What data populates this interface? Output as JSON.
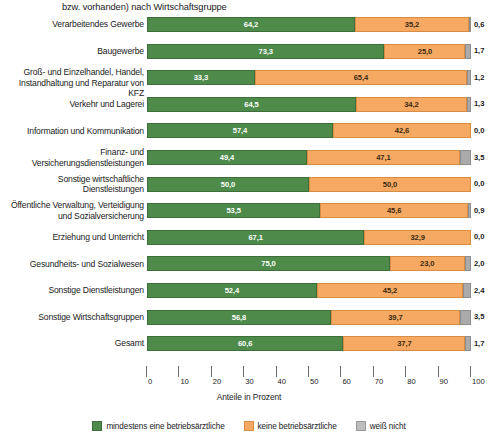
{
  "chart_data": {
    "type": "bar",
    "orientation": "horizontal",
    "stacked": true,
    "stack_total": 100,
    "title": "bzw. vorhanden) nach Wirtschaftsgruppe",
    "xlabel": "Anteile in Prozent",
    "ylabel": "",
    "xlim": [
      0,
      100
    ],
    "grid": false,
    "legend_position": "bottom",
    "xticks": [
      0,
      10,
      20,
      30,
      40,
      50,
      60,
      70,
      80,
      90,
      100
    ],
    "xticklabels": [
      "0",
      "10",
      "20",
      "30",
      "40",
      "50",
      "60",
      "70",
      "80",
      "90",
      "100"
    ],
    "categories": [
      "Verarbeitendes Gewerbe",
      "Baugewerbe",
      "Groß- und Einzelhandel, Handel,\nInstandhaltung und Reparatur von KFZ",
      "Verkehr und Lagerei",
      "Information und Kommunikation",
      "Finanz- und\nVersicherungsdienstleistungen",
      "Sonstige wirtschaftliche\nDienstleistungen",
      "Öffentliche Verwaltung, Verteidigung\nund Sozialversicherung",
      "Erziehung und Unterricht",
      "Gesundheits- und Sozialwesen",
      "Sonstige Dienstleistungen",
      "Sonstige Wirtschaftsgruppen",
      "Gesamt"
    ],
    "series": [
      {
        "name": "mindestens eine betriebsärztliche",
        "color": "#4e8b4a",
        "values": [
          64.2,
          73.3,
          33.3,
          64.5,
          57.4,
          49.4,
          50.0,
          53.5,
          67.1,
          75.0,
          52.4,
          56.8,
          60.6
        ],
        "labels": [
          "64,2",
          "73,3",
          "33,3",
          "64,5",
          "57,4",
          "49,4",
          "50,0",
          "53,5",
          "67,1",
          "75,0",
          "52,4",
          "56,8",
          "60,6"
        ]
      },
      {
        "name": "keine betriebsärztliche",
        "color": "#f6a963",
        "values": [
          35.2,
          25.0,
          65.4,
          34.2,
          42.6,
          47.1,
          50.0,
          45.6,
          32.9,
          23.0,
          45.2,
          39.7,
          37.7
        ],
        "labels": [
          "35,2",
          "25,0",
          "65,4",
          "34,2",
          "42,6",
          "47,1",
          "50,0",
          "45,6",
          "32,9",
          "23,0",
          "45,2",
          "39,7",
          "37,7"
        ]
      },
      {
        "name": "weiß nicht",
        "color": "#aaaaaa",
        "values": [
          0.6,
          1.7,
          1.2,
          1.3,
          0.0,
          3.5,
          0.0,
          0.9,
          0.0,
          2.0,
          2.4,
          3.5,
          1.7
        ],
        "labels": [
          "0,6",
          "1,7",
          "1,2",
          "1,3",
          "0,0",
          "3,5",
          "0,0",
          "0,9",
          "0,0",
          "2,0",
          "2,4",
          "3,5",
          "1,7"
        ]
      }
    ]
  },
  "legend": {
    "items": [
      {
        "label": "mindestens eine betriebsärztliche",
        "swatch": "green"
      },
      {
        "label": "keine betriebsärztliche",
        "swatch": "orange"
      },
      {
        "label": "weiß nicht",
        "swatch": "gray"
      }
    ]
  }
}
